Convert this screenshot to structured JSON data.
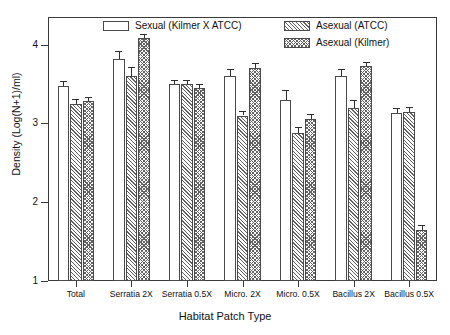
{
  "chart_data": {
    "type": "bar",
    "title": "",
    "xlabel": "Habitat Patch Type",
    "ylabel": "Density (Log(N+1)/ml)",
    "ylim": [
      1,
      4.35
    ],
    "yticks": [
      1,
      2,
      3,
      4
    ],
    "ytick_labels": [
      "1",
      "2",
      "3",
      "4"
    ],
    "grid": false,
    "legend_position": "top-inside",
    "categories": [
      "Total",
      "Serratia 2X",
      "Serratia 0.5X",
      "Micro. 2X",
      "Micro. 0.5X",
      "Bacillus 2X",
      "Bacillus 0.5X"
    ],
    "series": [
      {
        "name": "Sexual (Kilmer X ATCC)",
        "pattern": "open",
        "values": [
          3.47,
          3.82,
          3.5,
          3.6,
          3.3,
          3.6,
          3.13
        ],
        "errors": [
          0.07,
          0.1,
          0.05,
          0.09,
          0.12,
          0.09,
          0.07
        ]
      },
      {
        "name": "Asexual (ATCC)",
        "pattern": "diagonal-hatch",
        "values": [
          3.25,
          3.6,
          3.5,
          3.1,
          2.88,
          3.2,
          3.15
        ]
      },
      {
        "name": "Asexual (Kilmer)",
        "pattern": "cross-hatch",
        "values": [
          3.28,
          4.08,
          3.45,
          3.7,
          3.05,
          3.73,
          1.65
        ],
        "errors": [
          0.06,
          0.06,
          0.05,
          0.06,
          0.07,
          0.05,
          0.06
        ]
      }
    ],
    "series_errors_sexual": [
      0.07,
      0.1,
      0.05,
      0.09,
      0.12,
      0.09,
      0.07
    ],
    "series_errors_atcc": [
      0.06,
      0.12,
      0.05,
      0.06,
      0.07,
      0.1,
      0.06
    ]
  },
  "legend": {
    "items": [
      {
        "label": "Sexual (Kilmer X ATCC)",
        "pattern": "open"
      },
      {
        "label": "Asexual (ATCC)",
        "pattern": "diagonal-hatch"
      },
      {
        "label": "Asexual (Kilmer)",
        "pattern": "cross-hatch"
      }
    ]
  },
  "axes": {
    "y_title": "Density (Log(N+1)/ml)",
    "x_title": "Habitat Patch Type"
  }
}
